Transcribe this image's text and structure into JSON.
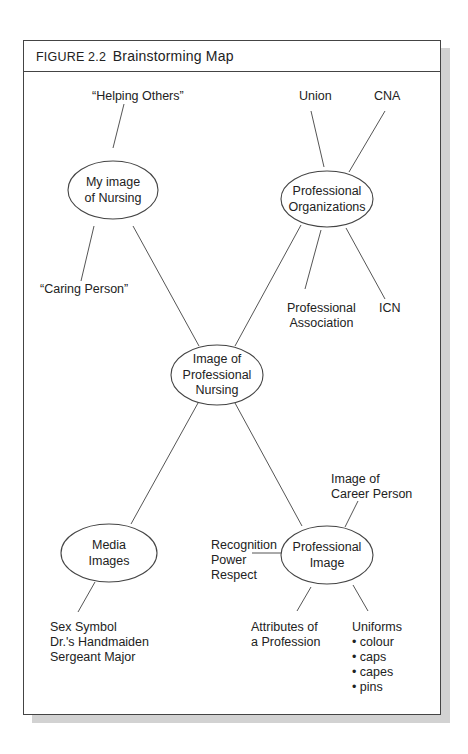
{
  "figure": {
    "number": "FIGURE 2.2",
    "title": "Brainstorming Map"
  },
  "nodes": {
    "center": {
      "lines": [
        "Image of",
        "Professional",
        "Nursing"
      ]
    },
    "my_image": {
      "lines": [
        "My image",
        "of Nursing"
      ]
    },
    "prof_orgs": {
      "lines": [
        "Professional",
        "Organizations"
      ]
    },
    "media": {
      "lines": [
        "Media",
        "Images"
      ]
    },
    "prof_image": {
      "lines": [
        "Professional",
        "Image"
      ]
    }
  },
  "leaves": {
    "helping_others": "“Helping Others”",
    "caring_person": "“Caring Person”",
    "union": "Union",
    "cna": "CNA",
    "prof_assoc": [
      "Professional",
      "Association"
    ],
    "icn": "ICN",
    "media_list": [
      "Sex Symbol",
      "Dr.'s Handmaiden",
      "Sergeant Major"
    ],
    "career_person": [
      "Image of",
      "Career Person"
    ],
    "recognition": [
      "Recognition",
      "Power",
      "Respect"
    ],
    "attributes": [
      "Attributes of",
      "a Profession"
    ],
    "uniforms": {
      "title": "Uniforms",
      "items": [
        "• colour",
        "• caps",
        "• capes",
        "• pins"
      ]
    }
  },
  "colors": {
    "line": "#555555",
    "border": "#444444",
    "shadow": "#d2d2d2"
  }
}
